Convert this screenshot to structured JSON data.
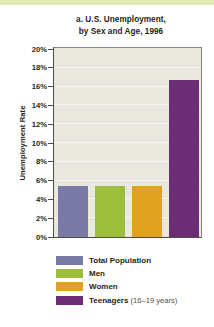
{
  "figure": {
    "title_line1": "a. U.S. Unemployment,",
    "title_line2": "by Sex and Age, 1996"
  },
  "chart_data": {
    "type": "bar",
    "title": "a. U.S. Unemployment, by Sex and Age, 1996",
    "xlabel": "",
    "ylabel": "Unemployment Rate",
    "ylim": [
      0,
      20
    ],
    "ytick_labels": [
      "20%",
      "18%",
      "16%",
      "14%",
      "12%",
      "10%",
      "8%",
      "6%",
      "4%",
      "2%",
      "0%"
    ],
    "ytick_values": [
      20,
      18,
      16,
      14,
      12,
      10,
      8,
      6,
      4,
      2,
      0
    ],
    "grid": true,
    "legend_position": "below",
    "categories": [
      "Total Population",
      "Men",
      "Women",
      "Teenagers (16-19 years)"
    ],
    "values": [
      5.4,
      5.4,
      5.4,
      16.7
    ],
    "colors": [
      "#7b7aa6",
      "#9cbe3c",
      "#e2a221",
      "#6c2d74"
    ],
    "series": [
      {
        "name": "Unemployment Rate",
        "values": [
          5.4,
          5.4,
          5.4,
          16.7
        ]
      }
    ]
  },
  "legend": {
    "items": [
      {
        "label": "Total Population",
        "note": "",
        "color": "#7b7aa6"
      },
      {
        "label": "Men",
        "note": "",
        "color": "#9cbe3c"
      },
      {
        "label": "Women",
        "note": "",
        "color": "#e2a221"
      },
      {
        "label": "Teenagers",
        "note": "(16–19 years)",
        "color": "#6c2d74"
      }
    ]
  }
}
